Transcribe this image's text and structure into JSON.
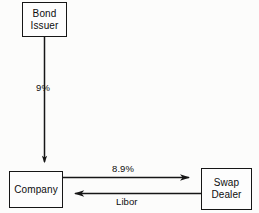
{
  "diagram": {
    "background_color": "#fcfcfb",
    "stroke_color": "#161616",
    "nodes": [
      {
        "id": "bond-issuer",
        "lines": [
          "Bond",
          "Issuer"
        ],
        "line1": "Bond",
        "line2": "Issuer"
      },
      {
        "id": "company",
        "lines": [
          "Company"
        ],
        "line1": "Company"
      },
      {
        "id": "swap-dealer",
        "lines": [
          "Swap",
          "Dealer"
        ],
        "line1": "Swap",
        "line2": "Dealer"
      }
    ],
    "edges": [
      {
        "id": "bond-issuer-to-company",
        "label": "9%",
        "from": "bond-issuer",
        "to": "company",
        "direction": "down"
      },
      {
        "id": "company-to-swap-dealer",
        "label": "8.9%",
        "from": "company",
        "to": "swap-dealer",
        "direction": "right"
      },
      {
        "id": "swap-dealer-to-company",
        "label": "Libor",
        "from": "swap-dealer",
        "to": "company",
        "direction": "left"
      }
    ]
  }
}
